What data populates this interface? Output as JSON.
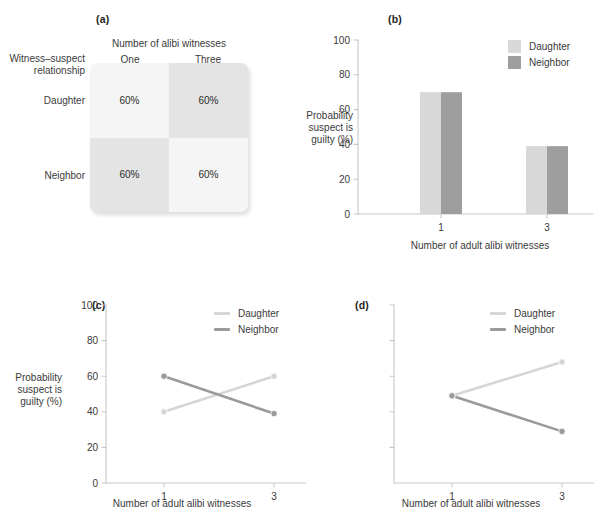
{
  "figure": {
    "panels": [
      "(a)",
      "(b)",
      "(c)",
      "(d)"
    ]
  },
  "panel_a": {
    "label": "(a)",
    "column_group_title": "Number of alibi witnesses",
    "row_group_title_line1": "Witness–suspect",
    "row_group_title_line2": "relationship",
    "col_headers": [
      "One",
      "Three"
    ],
    "row_headers": [
      "Daughter",
      "Neighbor"
    ],
    "cells": [
      [
        "60%",
        "60%"
      ],
      [
        "60%",
        "60%"
      ]
    ],
    "shades": [
      [
        "#f5f5f5",
        "#e4e4e4"
      ],
      [
        "#e4e4e4",
        "#f5f5f5"
      ]
    ]
  },
  "panel_b": {
    "label": "(b)",
    "legend": [
      {
        "name": "Daughter",
        "color": "#d8d8d8"
      },
      {
        "name": "Neighbor",
        "color": "#9e9e9e"
      }
    ]
  },
  "panel_c": {
    "label": "(c)",
    "legend": [
      {
        "name": "Daughter",
        "color": "#d6d6d6"
      },
      {
        "name": "Neighbor",
        "color": "#9a9a9a"
      }
    ]
  },
  "panel_d": {
    "label": "(d)",
    "legend": [
      {
        "name": "Daughter",
        "color": "#d6d6d6"
      },
      {
        "name": "Neighbor",
        "color": "#9a9a9a"
      }
    ]
  },
  "axis_text": {
    "ylabel_line1": "Probability",
    "ylabel_line2": "suspect is",
    "ylabel_line3": "guilty (%)",
    "xlabel": "Number of adult alibi witnesses",
    "ytick_labels": [
      "0",
      "20",
      "40",
      "60",
      "80",
      "100"
    ],
    "xtick_labels": [
      "1",
      "3"
    ]
  },
  "chart_data": [
    {
      "panel": "(a)",
      "type": "table",
      "title": "Number of alibi witnesses",
      "row_label": "Witness–suspect relationship",
      "columns": [
        "One",
        "Three"
      ],
      "rows": [
        "Daughter",
        "Neighbor"
      ],
      "values": [
        [
          60,
          60
        ],
        [
          60,
          60
        ]
      ],
      "value_labels": [
        [
          "60%",
          "60%"
        ],
        [
          "60%",
          "60%"
        ]
      ],
      "unit": "%"
    },
    {
      "panel": "(b)",
      "type": "bar",
      "categories": [
        "1",
        "3"
      ],
      "series": [
        {
          "name": "Daughter",
          "values": [
            70,
            39
          ],
          "color": "#d8d8d8"
        },
        {
          "name": "Neighbor",
          "values": [
            70,
            39
          ],
          "color": "#9e9e9e"
        }
      ],
      "xlabel": "Number of adult alibi witnesses",
      "ylabel": "Probability suspect is guilty (%)",
      "ylim": [
        0,
        100
      ],
      "yticks": [
        0,
        20,
        40,
        60,
        80,
        100
      ],
      "grid": false,
      "legend_position": "top-right"
    },
    {
      "panel": "(c)",
      "type": "line",
      "x": [
        "1",
        "3"
      ],
      "series": [
        {
          "name": "Daughter",
          "values": [
            40,
            60
          ],
          "color": "#d6d6d6"
        },
        {
          "name": "Neighbor",
          "values": [
            60,
            39
          ],
          "color": "#9a9a9a"
        }
      ],
      "xlabel": "Number of adult alibi witnesses",
      "ylabel": "Probability suspect is guilty (%)",
      "ylim": [
        0,
        100
      ],
      "yticks": [
        0,
        20,
        40,
        60,
        80,
        100
      ],
      "grid": false,
      "legend_position": "top-right"
    },
    {
      "panel": "(d)",
      "type": "line",
      "x": [
        "1",
        "3"
      ],
      "series": [
        {
          "name": "Daughter",
          "values": [
            49,
            68
          ],
          "color": "#d6d6d6"
        },
        {
          "name": "Neighbor",
          "values": [
            49,
            29
          ],
          "color": "#9a9a9a"
        }
      ],
      "xlabel": "Number of adult alibi witnesses",
      "ylabel": "",
      "ylim": [
        0,
        100
      ],
      "yticks": [
        0,
        20,
        40,
        60,
        80,
        100
      ],
      "ytick_labels_shown": false,
      "grid": false,
      "legend_position": "top-right"
    }
  ]
}
